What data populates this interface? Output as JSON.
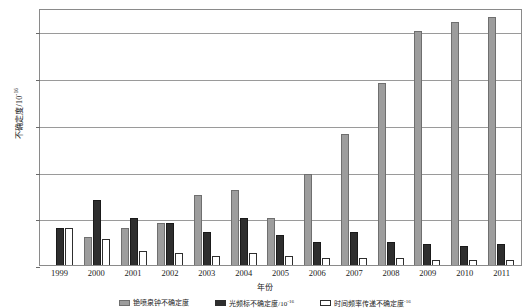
{
  "chart_data": {
    "type": "bar",
    "title": "",
    "xlabel": "年份",
    "ylabel": "不确定度/10",
    "ylabel_exponent": "-16",
    "categories": [
      "1999",
      "2000",
      "2001",
      "2002",
      "2003",
      "2004",
      "2005",
      "2006",
      "2007",
      "2008",
      "2009",
      "2010",
      "2011"
    ],
    "ylim": [
      0,
      55
    ],
    "yticks": [
      0,
      10,
      20,
      30,
      40,
      50
    ],
    "ytick_labels": [
      "0",
      "10",
      "20",
      "30",
      "40",
      "50"
    ],
    "grid": true,
    "legend_position": "bottom",
    "series": [
      {
        "name": "铯喷泉钟不确定度",
        "color": "#9d9d9d",
        "values": [
          null,
          6,
          8,
          9,
          15,
          16,
          10,
          19.5,
          28,
          39,
          50,
          52,
          53
        ]
      },
      {
        "name": "光频标不确定度/10",
        "name_exponent": "-16",
        "color": "#2e2e2e",
        "values": [
          8,
          14,
          10,
          9,
          7,
          10,
          6.5,
          5,
          7,
          5,
          4.5,
          4,
          4.5
        ]
      },
      {
        "name": "时间频率传递不确定度",
        "name_exponent": "-16",
        "color": "#ffffff",
        "values": [
          8,
          5.5,
          3,
          2.5,
          2,
          2.5,
          2,
          1.5,
          1.5,
          1.5,
          1,
          1,
          1
        ]
      }
    ]
  },
  "axis": {
    "y_title_main": "不确定度/10",
    "y_title_sup": "-16",
    "x_title": "年份"
  }
}
